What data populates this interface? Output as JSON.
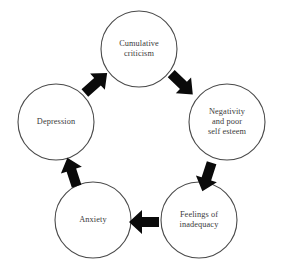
{
  "diagram": {
    "type": "cycle-diagram",
    "background_color": "#ffffff",
    "circle_stroke_color": "#4a4a4a",
    "arrow_color": "#0a0a0a",
    "text_color": "#3a3a3a",
    "nodes": [
      {
        "id": "cumulative-criticism",
        "label": "Cumulative\ncriticism",
        "cx": 139,
        "cy": 49,
        "r": 38
      },
      {
        "id": "negativity-and-poor-self-esteem",
        "label": "Negativity\nand poor\nself esteem",
        "cx": 227,
        "cy": 122,
        "r": 38
      },
      {
        "id": "feelings-of-inadequacy",
        "label": "Feelings of\ninadequacy",
        "cx": 199,
        "cy": 220,
        "r": 38
      },
      {
        "id": "anxiety",
        "label": "Anxiety",
        "cx": 93,
        "cy": 220,
        "r": 38
      },
      {
        "id": "depression",
        "label": "Depression",
        "cx": 56,
        "cy": 122,
        "r": 38
      }
    ],
    "arrows": [
      {
        "id": "arrow-depression-to-cumulative-criticism",
        "direction": "up-right",
        "from": "depression",
        "to": "cumulative-criticism"
      },
      {
        "id": "arrow-cumulative-criticism-to-negativity",
        "direction": "down-right",
        "from": "cumulative-criticism",
        "to": "negativity-and-poor-self-esteem"
      },
      {
        "id": "arrow-negativity-to-feelings-of-inadequacy",
        "direction": "down-left",
        "from": "negativity-and-poor-self-esteem",
        "to": "feelings-of-inadequacy"
      },
      {
        "id": "arrow-feelings-of-inadequacy-to-anxiety",
        "direction": "left",
        "from": "feelings-of-inadequacy",
        "to": "anxiety"
      },
      {
        "id": "arrow-anxiety-to-depression",
        "direction": "up-left",
        "from": "anxiety",
        "to": "depression"
      }
    ]
  }
}
